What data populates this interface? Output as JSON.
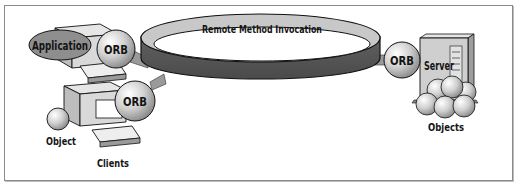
{
  "diagram": {
    "ring_label": "Remote Method Invocation",
    "clients": {
      "label": "Clients",
      "client_1": {
        "application_label": "Application",
        "orb_label": "ORB"
      },
      "client_2": {
        "object_label": "Object",
        "orb_label": "ORB"
      }
    },
    "server": {
      "orb_label": "ORB",
      "server_label": "Server",
      "objects_label": "Objects"
    },
    "colors": {
      "ring_top": "#c8c8c8",
      "ring_side": "#5e5e5e",
      "sphere": "#cfcfcf",
      "ellipse": "#8e8e8e",
      "computer": "#d9d9d9",
      "outline": "#111111"
    }
  }
}
